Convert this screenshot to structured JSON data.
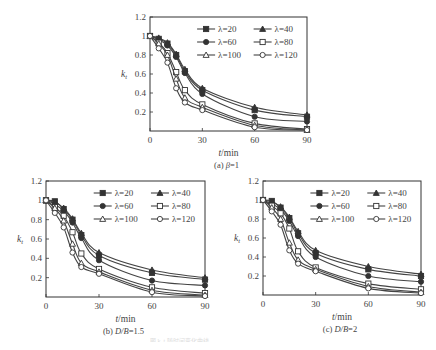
{
  "figure_caption": "图 k_t 随时间变化曲线",
  "chart_data": [
    {
      "type": "line",
      "id": "a",
      "caption": "(a)  β=1",
      "xlabel": "t/min",
      "ylabel": "k_t",
      "xlim": [
        0,
        90
      ],
      "ylim": [
        0,
        1.2
      ],
      "xticks": [
        0,
        30,
        60,
        90
      ],
      "yticks": [
        0.2,
        0.4,
        0.6,
        0.8,
        1,
        1.2
      ],
      "x": [
        0,
        5,
        10,
        15,
        20,
        30,
        60,
        90
      ],
      "legend_position": "upper right",
      "series": [
        {
          "name": "λ=20",
          "marker": "square-filled",
          "values": [
            1,
            0.97,
            0.92,
            0.8,
            0.63,
            0.43,
            0.22,
            0.15
          ]
        },
        {
          "name": "λ=40",
          "marker": "triangle-filled",
          "values": [
            1,
            0.98,
            0.93,
            0.81,
            0.65,
            0.45,
            0.25,
            0.17
          ]
        },
        {
          "name": "λ=60",
          "marker": "circle-filled",
          "values": [
            1,
            0.96,
            0.9,
            0.78,
            0.61,
            0.39,
            0.15,
            0.1
          ]
        },
        {
          "name": "λ=80",
          "marker": "square-open",
          "values": [
            1,
            0.93,
            0.82,
            0.62,
            0.43,
            0.28,
            0.08,
            0.02
          ]
        },
        {
          "name": "λ=100",
          "marker": "triangle-open",
          "values": [
            1,
            0.92,
            0.8,
            0.55,
            0.35,
            0.25,
            0.06,
            0.01
          ]
        },
        {
          "name": "λ=120",
          "marker": "circle-open",
          "values": [
            1,
            0.87,
            0.72,
            0.45,
            0.3,
            0.22,
            0.04,
            0.01
          ]
        }
      ]
    },
    {
      "type": "line",
      "id": "b",
      "caption": "(b)  D/B=1.5",
      "xlabel": "t/min",
      "ylabel": "k_t",
      "xlim": [
        0,
        90
      ],
      "ylim": [
        0,
        1.2
      ],
      "xticks": [
        0,
        30,
        60,
        90
      ],
      "yticks": [
        0.2,
        0.4,
        0.6,
        0.8,
        1,
        1.2
      ],
      "x": [
        0,
        5,
        10,
        15,
        20,
        30,
        60,
        90
      ],
      "legend_position": "upper right",
      "series": [
        {
          "name": "λ=20",
          "marker": "square-filled",
          "values": [
            1,
            0.99,
            0.91,
            0.8,
            0.64,
            0.43,
            0.25,
            0.18
          ]
        },
        {
          "name": "λ=40",
          "marker": "triangle-filled",
          "values": [
            1,
            0.98,
            0.92,
            0.81,
            0.66,
            0.46,
            0.28,
            0.2
          ]
        },
        {
          "name": "λ=60",
          "marker": "circle-filled",
          "values": [
            1,
            0.96,
            0.89,
            0.77,
            0.61,
            0.38,
            0.17,
            0.12
          ]
        },
        {
          "name": "λ=80",
          "marker": "square-open",
          "values": [
            1,
            0.93,
            0.84,
            0.67,
            0.45,
            0.29,
            0.1,
            0.04
          ]
        },
        {
          "name": "λ=100",
          "marker": "triangle-open",
          "values": [
            1,
            0.92,
            0.79,
            0.55,
            0.35,
            0.26,
            0.07,
            0.02
          ]
        },
        {
          "name": "λ=120",
          "marker": "circle-open",
          "values": [
            1,
            0.87,
            0.72,
            0.46,
            0.31,
            0.24,
            0.05,
            0.01
          ]
        }
      ]
    },
    {
      "type": "line",
      "id": "c",
      "caption": "(c)  D/B=2",
      "xlabel": "t/min",
      "ylabel": "k_t",
      "xlim": [
        0,
        90
      ],
      "ylim": [
        0,
        1.2
      ],
      "xticks": [
        0,
        30,
        60,
        90
      ],
      "yticks": [
        0.2,
        0.4,
        0.6,
        0.8,
        1,
        1.2
      ],
      "x": [
        0,
        5,
        10,
        15,
        20,
        30,
        60,
        90
      ],
      "legend_position": "upper right",
      "series": [
        {
          "name": "λ=20",
          "marker": "square-filled",
          "values": [
            1,
            0.99,
            0.92,
            0.81,
            0.65,
            0.44,
            0.27,
            0.2
          ]
        },
        {
          "name": "λ=40",
          "marker": "triangle-filled",
          "values": [
            1,
            0.98,
            0.93,
            0.82,
            0.67,
            0.47,
            0.3,
            0.22
          ]
        },
        {
          "name": "λ=60",
          "marker": "circle-filled",
          "values": [
            1,
            0.96,
            0.9,
            0.78,
            0.62,
            0.4,
            0.2,
            0.14
          ]
        },
        {
          "name": "λ=80",
          "marker": "square-open",
          "values": [
            1,
            0.94,
            0.86,
            0.7,
            0.46,
            0.29,
            0.12,
            0.06
          ]
        },
        {
          "name": "λ=100",
          "marker": "triangle-open",
          "values": [
            1,
            0.92,
            0.8,
            0.55,
            0.37,
            0.27,
            0.09,
            0.03
          ]
        },
        {
          "name": "λ=120",
          "marker": "circle-open",
          "values": [
            1,
            0.88,
            0.74,
            0.47,
            0.33,
            0.25,
            0.07,
            0.02
          ]
        }
      ]
    }
  ]
}
